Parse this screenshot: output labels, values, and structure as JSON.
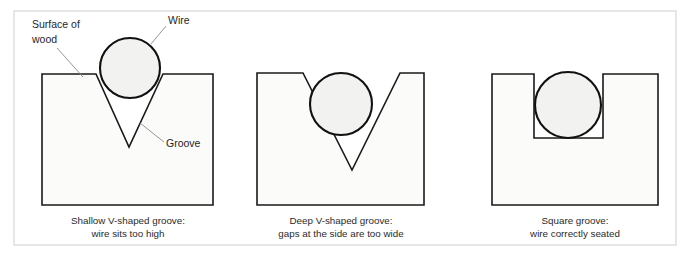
{
  "figure": {
    "frame": {
      "stroke_color": "#d8d8d8"
    },
    "colors": {
      "wood_fill": "#fbfbfa",
      "wood_stroke": "#1a1a1a",
      "wire_fill": "#f2f2f1",
      "wire_stroke": "#111111",
      "leader_line": "#8a8a8a",
      "text": "#1f1f1f",
      "background": "#ffffff"
    }
  },
  "callouts": {
    "surface_of_wood_line1": "Surface of",
    "surface_of_wood_line2": "wood",
    "wire": "Wire",
    "groove": "Groove"
  },
  "panels": [
    {
      "id": "shallow-v-groove",
      "groove_type": "shallow-v",
      "caption_line1": "Shallow V-shaped groove:",
      "caption_line2": "wire sits too high",
      "verdict": "too-high",
      "block": {
        "left": 42,
        "right": 213,
        "top": 74,
        "bottom": 205
      },
      "groove": {
        "mouth_left": 96,
        "mouth_right": 163,
        "apex_x": 129,
        "apex_y": 147
      },
      "wire": {
        "cx": 130,
        "cy": 68,
        "r": 30
      },
      "caption_center_x": 128
    },
    {
      "id": "deep-v-groove",
      "groove_type": "deep-v",
      "caption_line1": "Deep V-shaped groove:",
      "caption_line2": "gaps at the side are too wide",
      "verdict": "gaps-too-wide",
      "block": {
        "left": 257,
        "right": 424,
        "top": 73,
        "bottom": 205
      },
      "groove": {
        "mouth_left": 303,
        "mouth_right": 400,
        "apex_x": 352,
        "apex_y": 170
      },
      "wire": {
        "cx": 341,
        "cy": 104,
        "r": 31
      },
      "caption_center_x": 341
    },
    {
      "id": "square-groove",
      "groove_type": "square",
      "caption_line1": "Square groove:",
      "caption_line2": "wire correctly seated",
      "verdict": "correct",
      "block": {
        "left": 492,
        "right": 658,
        "top": 74,
        "bottom": 205
      },
      "groove": {
        "left": 534,
        "right": 603,
        "bottom": 138
      },
      "wire": {
        "cx": 568,
        "cy": 105,
        "r": 33
      },
      "caption_center_x": 575
    }
  ]
}
